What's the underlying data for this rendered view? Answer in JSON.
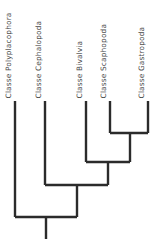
{
  "figure": {
    "type": "cladogram",
    "orientation": "vertical-tips-up",
    "background_color": "#ffffff",
    "line_color": "#2b2b2b",
    "line_width": 2.4,
    "label_color": "#4a4a4a",
    "label_rotation_deg": -90
  },
  "taxa": [
    {
      "id": "polyplacophora",
      "label": "Classe Polyplacophora",
      "tip_x": 15,
      "tip_y_top": 101,
      "label_left": 12
    },
    {
      "id": "cephalopoda",
      "label": "Classe Cephalopoda",
      "tip_x": 45,
      "tip_y_top": 101,
      "label_left": 42
    },
    {
      "id": "bivalvia",
      "label": "Classe Bivalvia",
      "tip_x": 86,
      "tip_y_top": 101,
      "label_left": 83
    },
    {
      "id": "scaphopoda",
      "label": "Classe Scaphopoda",
      "tip_x": 110,
      "tip_y_top": 101,
      "label_left": 107
    },
    {
      "id": "gastropoda",
      "label": "Classe Gastropoda",
      "tip_x": 148,
      "tip_y_top": 101,
      "label_left": 145
    }
  ],
  "nodes": [
    {
      "id": "node-scaphopoda-gastropoda",
      "children": [
        "scaphopoda",
        "gastropoda"
      ],
      "bar_y": 133,
      "bar_x1": 110,
      "bar_x2": 148,
      "stem_x": 130
    },
    {
      "id": "node-bivalvia-clade",
      "children": [
        "bivalvia",
        "node-scaphopoda-gastropoda"
      ],
      "bar_y": 162,
      "bar_x1": 86,
      "bar_x2": 130,
      "stem_x": 108
    },
    {
      "id": "node-cephalopoda-clade",
      "children": [
        "cephalopoda",
        "node-bivalvia-clade"
      ],
      "bar_y": 185,
      "bar_x1": 45,
      "bar_x2": 108,
      "stem_x": 77
    },
    {
      "id": "node-root",
      "children": [
        "polyplacophora",
        "node-cephalopoda-clade"
      ],
      "bar_y": 217,
      "bar_x1": 15,
      "bar_x2": 77,
      "stem_x": 46
    }
  ],
  "root_stem": {
    "x": 46,
    "y_top": 217,
    "y_bottom": 239
  }
}
